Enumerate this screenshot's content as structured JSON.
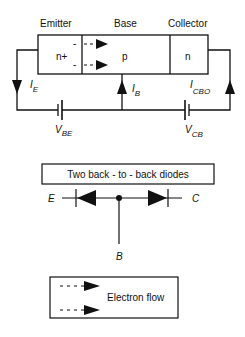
{
  "transistor": {
    "regions": [
      {
        "name": "Emitter",
        "doping": "n+"
      },
      {
        "name": "Base",
        "doping": "p"
      },
      {
        "name": "Collector",
        "doping": "n"
      }
    ],
    "currents": {
      "emitter": {
        "symbol": "I",
        "sub": "E"
      },
      "base": {
        "symbol": "I",
        "sub": "B"
      },
      "collector": {
        "symbol": "I",
        "sub": "CBO"
      }
    },
    "voltages": {
      "base_emitter": {
        "symbol": "V",
        "sub": "BE"
      },
      "collector_base": {
        "symbol": "V",
        "sub": "CB"
      }
    },
    "electron_marks": [
      "-",
      "-"
    ]
  },
  "diode_model": {
    "title": "Two back - to - back diodes",
    "terminals": {
      "emitter": "E",
      "collector": "C",
      "base": "B"
    }
  },
  "legend": {
    "label": "Electron flow"
  },
  "colors": {
    "line": "#111111",
    "background": "#ffffff"
  }
}
